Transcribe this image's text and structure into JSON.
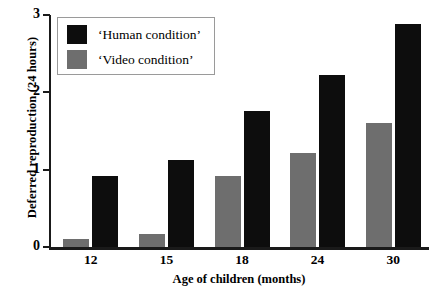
{
  "chart_data": {
    "type": "bar",
    "title": "",
    "xlabel": "Age of children (months)",
    "ylabel": "Deferred reproduction (24 hours)",
    "categories": [
      "12",
      "15",
      "18",
      "24",
      "30"
    ],
    "series": [
      {
        "name": "‘Human condition’",
        "color": "#0d0d0d",
        "values": [
          0.92,
          1.13,
          1.76,
          2.23,
          2.88
        ]
      },
      {
        "name": "‘Video condition’",
        "color": "#6e6e6e",
        "values": [
          0.1,
          0.17,
          0.92,
          1.22,
          1.6
        ]
      }
    ],
    "ylim": [
      0,
      3
    ],
    "yticks": [
      0,
      1,
      2,
      3
    ],
    "ytick_labels": [
      "0",
      "1",
      "2",
      "3"
    ],
    "grid": false,
    "legend_position": "top-left"
  },
  "legend": {
    "entries": [
      {
        "label": "‘Human condition’",
        "color": "#0d0d0d"
      },
      {
        "label": "‘Video condition’",
        "color": "#6e6e6e"
      }
    ]
  },
  "axes": {
    "y_title": "Deferred reproduction (24 hours)",
    "x_title": "Age of children (months)",
    "y_ticks": [
      "3",
      "2",
      "1",
      "0"
    ],
    "x_ticks": [
      "12",
      "15",
      "18",
      "24",
      "30"
    ]
  }
}
